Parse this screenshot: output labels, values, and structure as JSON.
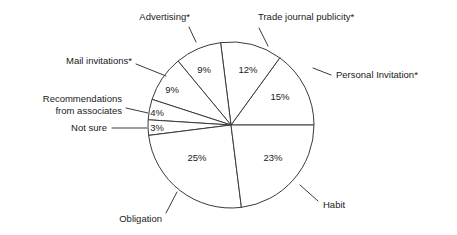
{
  "chart_data": {
    "type": "pie",
    "title": "",
    "subtitle": "",
    "xlabel": "",
    "ylabel": "",
    "legend_position": "none",
    "grid": false,
    "value_suffix": "%",
    "total": 100,
    "footnote_marker": "*",
    "categories": [
      "Personal Invitation*",
      "Trade journal publicity*",
      "Advertising*",
      "Mail invitations*",
      "Recommendations from associates",
      "Not sure",
      "Obligation",
      "Habit"
    ],
    "values": [
      15,
      12,
      9,
      9,
      4,
      3,
      25,
      23
    ],
    "slices": [
      {
        "label": "Personal Invitation*",
        "label_line1": "Personal Invitation*",
        "label_line2": "",
        "value": 15,
        "value_text": "15%",
        "start_angle_deg": 0,
        "end_angle_deg": 54,
        "pct_x": 280,
        "pct_y": 97,
        "label_x": 336,
        "label_y": 75,
        "label_anchor": "start",
        "leader": {
          "x1": 313,
          "y1": 68,
          "x2": 331,
          "y2": 75
        }
      },
      {
        "label": "Trade journal publicity*",
        "label_line1": "Trade journal publicity*",
        "label_line2": "",
        "value": 12,
        "value_text": "12%",
        "start_angle_deg": 54,
        "end_angle_deg": 97.2,
        "pct_x": 248,
        "pct_y": 70,
        "label_x": 258,
        "label_y": 17,
        "label_anchor": "start",
        "leader": {
          "x1": 268,
          "y1": 46,
          "x2": 259,
          "y2": 28
        }
      },
      {
        "label": "Advertising*",
        "label_line1": "Advertising*",
        "label_line2": "",
        "value": 9,
        "value_text": "9%",
        "start_angle_deg": 97.2,
        "end_angle_deg": 129.6,
        "pct_x": 204,
        "pct_y": 70,
        "label_x": 190,
        "label_y": 17,
        "label_anchor": "end",
        "leader": {
          "x1": 196,
          "y1": 42,
          "x2": 189,
          "y2": 27
        }
      },
      {
        "label": "Mail invitations*",
        "label_line1": "Mail invitations*",
        "label_line2": "",
        "value": 9,
        "value_text": "9%",
        "start_angle_deg": 129.6,
        "end_angle_deg": 162,
        "pct_x": 172,
        "pct_y": 90,
        "label_x": 132,
        "label_y": 61,
        "label_anchor": "end",
        "leader": {
          "x1": 166,
          "y1": 76,
          "x2": 136,
          "y2": 64
        }
      },
      {
        "label": "Recommendations from associates",
        "label_line1": "Recommendations",
        "label_line2": "from associates",
        "value": 4,
        "value_text": "4%",
        "start_angle_deg": 162,
        "end_angle_deg": 176.4,
        "pct_x": 157,
        "pct_y": 113,
        "label_x": 122,
        "label_y": 99,
        "label_anchor": "end",
        "leader": {
          "x1": 148,
          "y1": 113,
          "x2": 126,
          "y2": 108
        }
      },
      {
        "label": "Not sure",
        "label_line1": "Not sure",
        "label_line2": "",
        "value": 3,
        "value_text": "3%",
        "start_angle_deg": 176.4,
        "end_angle_deg": 187.2,
        "pct_x": 157,
        "pct_y": 128,
        "label_x": 107,
        "label_y": 128,
        "label_anchor": "end",
        "leader": {
          "x1": 147,
          "y1": 128,
          "x2": 112,
          "y2": 128
        }
      },
      {
        "label": "Obligation",
        "label_line1": "Obligation",
        "label_line2": "",
        "value": 25,
        "value_text": "25%",
        "start_angle_deg": 187.2,
        "end_angle_deg": 277.2,
        "pct_x": 197,
        "pct_y": 158,
        "label_x": 162,
        "label_y": 219,
        "label_anchor": "end",
        "leader": {
          "x1": 177,
          "y1": 192,
          "x2": 166,
          "y2": 213
        }
      },
      {
        "label": "Habit",
        "label_line1": "Habit",
        "label_line2": "",
        "value": 23,
        "value_text": "23%",
        "start_angle_deg": 277.2,
        "end_angle_deg": 360,
        "pct_x": 273,
        "pct_y": 158,
        "label_x": 323,
        "label_y": 205,
        "label_anchor": "start",
        "leader": {
          "x1": 300,
          "y1": 185,
          "x2": 318,
          "y2": 201
        }
      }
    ],
    "geometry": {
      "center_x": 231,
      "center_y": 125,
      "radius": 83
    },
    "colors": {
      "background": "#ffffff",
      "slice_fill": "#ffffff",
      "stroke": "#3a3a3a",
      "text": "#1a1a1a"
    }
  }
}
